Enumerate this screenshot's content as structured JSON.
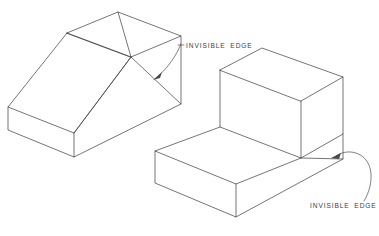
{
  "page": {
    "background_color": "#ffffff",
    "line_color": "#3a3a3a",
    "text_color": "#3d3d3d",
    "width": 379,
    "height": 236
  },
  "callouts": [
    {
      "id": "callout-left",
      "label": "INVISIBLE  EDGE",
      "text_x": 186,
      "text_y": 48,
      "points_to": "left-solid-hidden-vertex"
    },
    {
      "id": "callout-right",
      "label": "INVISIBLE  EDGE",
      "text_x": 310,
      "text_y": 208,
      "points_to": "right-solid-hidden-vertex"
    }
  ],
  "figures": [
    {
      "id": "left-solid",
      "name": "truncated-wedge-block",
      "description": "Isometric block with sloped chamfered top and pyramidal hip faces"
    },
    {
      "id": "right-solid",
      "name": "l-shaped-step-block",
      "description": "Isometric L-shaped step block with upper rectangular prism on lower base slab"
    }
  ]
}
